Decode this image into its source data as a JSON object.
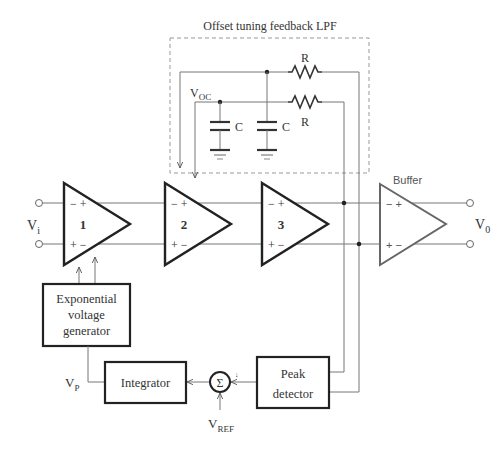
{
  "diagram": {
    "feedback_block": {
      "title": "Offset tuning feedback LPF"
    },
    "components": {
      "resistor_top": "R",
      "resistor_bottom": "R",
      "cap_left": "C",
      "cap_right": "C",
      "node_voc": {
        "main": "V",
        "sub": "OC"
      }
    },
    "amplifiers": [
      {
        "id": "1",
        "label": "1"
      },
      {
        "id": "2",
        "label": "2"
      },
      {
        "id": "3",
        "label": "3"
      }
    ],
    "buffer": {
      "label": "Buffer"
    },
    "pins": {
      "top": "− +",
      "bottom": "+ −"
    },
    "input": {
      "main": "V",
      "sub": "i"
    },
    "output": {
      "main": "V",
      "sub": "0"
    },
    "blocks": {
      "exp_gen": [
        "Exponential",
        "voltage",
        "generator"
      ],
      "integrator": "Integrator",
      "peak": [
        "Peak",
        "detector"
      ],
      "sum": "Σ"
    },
    "signals": {
      "vp": {
        "main": "V",
        "sub": "P"
      },
      "vref": {
        "main": "V",
        "sub": "REF"
      },
      "sum_sign": "↓"
    }
  }
}
